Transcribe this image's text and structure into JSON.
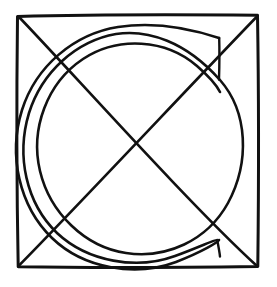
{
  "image": {
    "title": "Square with diagonals and inscribed spiral",
    "description": "Hand-drawn black line figure on a white background",
    "width": 277,
    "height": 287,
    "background_color": "#ffffff",
    "ink_color": "#111111"
  },
  "figure": {
    "style": "hand-drawn line art",
    "stroke_color": "#111111",
    "square": {
      "name": "outer square",
      "left": 17,
      "top": 15,
      "right": 258,
      "bottom": 267,
      "width": 241,
      "height": 252,
      "stroke_width": 3.0,
      "corners": [
        [
          17,
          15
        ],
        [
          258,
          15
        ],
        [
          258,
          267
        ],
        [
          17,
          267
        ]
      ]
    },
    "diagonals": [
      {
        "name": "diagonal top-left to bottom-right",
        "from": [
          17,
          15
        ],
        "to": [
          258,
          267
        ],
        "stroke_width": 2.6
      },
      {
        "name": "diagonal top-right to bottom-left",
        "from": [
          258,
          15
        ],
        "to": [
          17,
          267
        ],
        "stroke_width": 2.6
      }
    ],
    "diagonal_intersection": [
      138,
      141
    ],
    "spiral": {
      "name": "inscribed spiral",
      "center": [
        138,
        141
      ],
      "turns": 2.6,
      "visible_passes_left_side": 3,
      "visible_passes_right_side": 1,
      "outer_radius": 122,
      "inner_radius": 104,
      "stroke_width": 2.6,
      "start_angle_deg": -55,
      "end_angle_deg": 305
    },
    "spiral_ticks": [
      {
        "name": "upper-right spiral terminator",
        "from": [
          219,
          38
        ],
        "to": [
          219,
          79
        ],
        "stroke_width": 2.4
      },
      {
        "name": "lower-right spiral terminator",
        "from": [
          217,
          240
        ],
        "to": [
          220,
          256
        ],
        "stroke_width": 2.4
      }
    ]
  }
}
